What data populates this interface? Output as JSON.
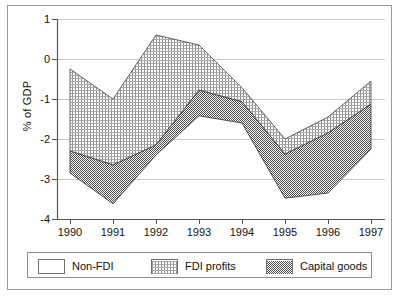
{
  "chart_data": {
    "type": "area",
    "title": "",
    "subtitle": "",
    "xlabel": "",
    "ylabel": "% of GDP",
    "categories": [
      "1990",
      "1991",
      "1992",
      "1993",
      "1994",
      "1995",
      "1996",
      "1997"
    ],
    "x": [
      1990,
      1991,
      1992,
      1993,
      1994,
      1995,
      1996,
      1997
    ],
    "xlim": [
      1990,
      1997
    ],
    "ylim": [
      -4,
      1
    ],
    "yticks": [
      "1",
      "0",
      "-1",
      "-2",
      "-3",
      "-4"
    ],
    "ytick_values": [
      1,
      0,
      -1,
      -2,
      -3,
      -4
    ],
    "xticks": [
      "1990",
      "1991",
      "1992",
      "1993",
      "1994",
      "1995",
      "1996",
      "1997"
    ],
    "grid": "horizontal",
    "legend_position": "bottom",
    "stacking": "boundaries",
    "boundaries": {
      "top_of_fdi_profits": [
        -0.25,
        -1.0,
        0.6,
        0.35,
        -0.72,
        -2.0,
        -1.45,
        -0.55
      ],
      "top_of_capital_goods": [
        -2.3,
        -2.65,
        -2.15,
        -0.78,
        -1.07,
        -2.38,
        -1.85,
        -1.13
      ],
      "bottom_total": [
        -2.85,
        -3.62,
        -2.4,
        -1.42,
        -1.6,
        -3.48,
        -3.35,
        -2.25
      ]
    },
    "series": [
      {
        "name": "Non-FDI",
        "fill": "white",
        "values": [
          -0.25,
          -1.0,
          0.6,
          0.35,
          -0.72,
          -2.0,
          -1.45,
          -0.55
        ]
      },
      {
        "name": "FDI profits",
        "fill": "fine-grid-hatch",
        "values": [
          2.05,
          1.65,
          2.75,
          1.13,
          0.35,
          0.38,
          0.4,
          0.58
        ]
      },
      {
        "name": "Capital goods",
        "fill": "dark-checker",
        "values": [
          0.55,
          0.97,
          0.25,
          0.64,
          0.53,
          1.1,
          1.5,
          1.12
        ]
      }
    ]
  },
  "legend": {
    "items": [
      {
        "label": "Non-FDI",
        "pattern": "white",
        "color": "#ffffff"
      },
      {
        "label": "FDI profits",
        "pattern": "fine-grid-hatch",
        "color": "#b5b5b5"
      },
      {
        "label": "Capital goods",
        "pattern": "dark-checker",
        "color": "#7a7a7a"
      }
    ]
  },
  "axis": {
    "y_title": "% of GDP",
    "y_tick_1": "1",
    "y_tick_0": "0",
    "y_tick_m1": "-1",
    "y_tick_m2": "-2",
    "y_tick_m3": "-3",
    "y_tick_m4": "-4",
    "x_tick_1990": "1990",
    "x_tick_1991": "1991",
    "x_tick_1992": "1992",
    "x_tick_1993": "1993",
    "x_tick_1994": "1994",
    "x_tick_1995": "1995",
    "x_tick_1996": "1996",
    "x_tick_1997": "1997"
  }
}
